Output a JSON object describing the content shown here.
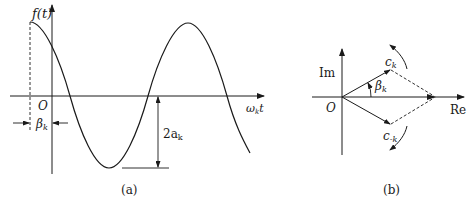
{
  "panel_a": {
    "y_label": "f(t)",
    "origin_label": "O",
    "x_label": "ω",
    "x_label_sub": "k",
    "x_label_suffix": "t",
    "phase_label": "β",
    "phase_label_sub": "k",
    "amplitude_label": "2a",
    "amplitude_label_sub": "k",
    "caption": "(a)"
  },
  "panel_b": {
    "im_label": "Im",
    "re_label": "Re",
    "origin_label": "O",
    "ck_label": "c",
    "ck_sub": "k",
    "cmk_label": "c",
    "cmk_sub": "-k",
    "angle_label": "β",
    "angle_sub": "k",
    "caption": "(b)"
  },
  "colors": {
    "stroke": "#1a1a1a",
    "background": "#ffffff"
  }
}
